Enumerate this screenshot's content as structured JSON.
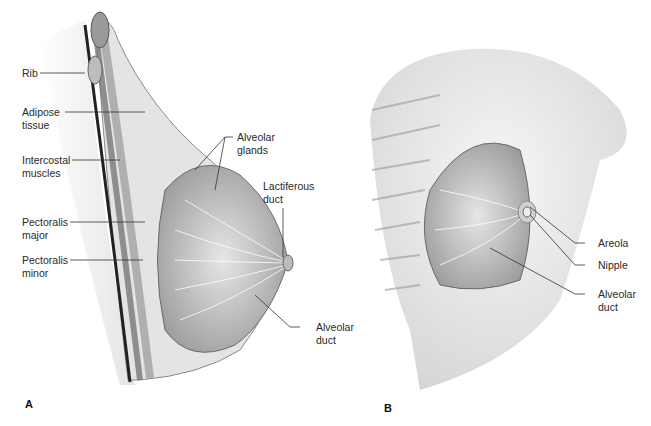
{
  "panel_a": {
    "letter": "A",
    "labels": {
      "rib": "Rib",
      "adipose": "Adipose\ntissue",
      "intercostal": "Intercostal\nmuscles",
      "pect_major": "Pectoralis\nmajor",
      "pect_minor": "Pectoralis\nminor",
      "alveolar_glands": "Alveolar\nglands",
      "lactiferous": "Lactiferous\nduct",
      "alveolar_duct": "Alveolar\nduct"
    }
  },
  "panel_b": {
    "letter": "B",
    "labels": {
      "areola": "Areola",
      "nipple": "Nipple",
      "alveolar_duct": "Alveolar\nduct"
    }
  }
}
